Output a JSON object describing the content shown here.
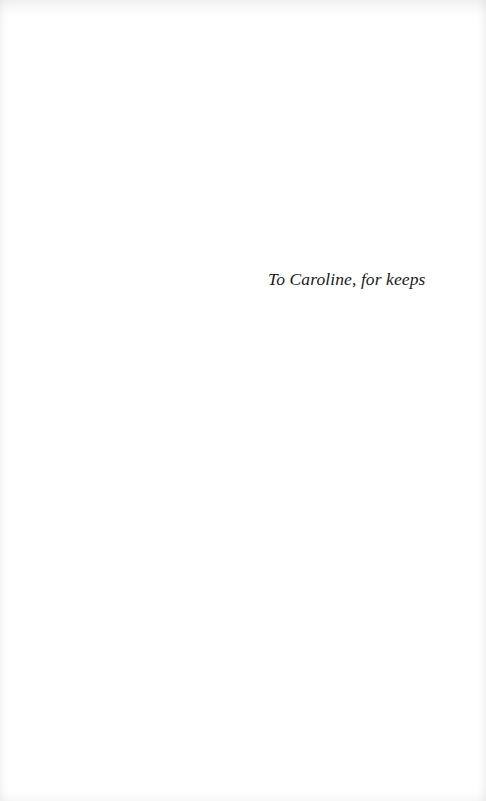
{
  "page": {
    "type": "dedication",
    "background": "#ffffff",
    "text_color": "#1a1a1a"
  },
  "dedication": {
    "text": "To Caroline, for keeps"
  }
}
